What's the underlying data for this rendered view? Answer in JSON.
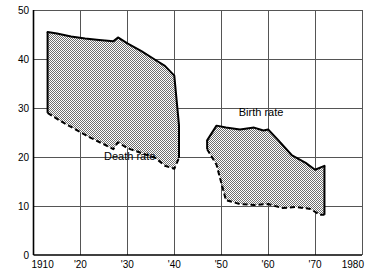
{
  "chart_data": {
    "type": "area",
    "title": "",
    "subtitle": "",
    "xlabel": "",
    "ylabel": "",
    "xlim": [
      1910,
      1980
    ],
    "ylim": [
      0,
      50
    ],
    "grid": true,
    "legend_position": "inline-annotation",
    "x_ticks": [
      {
        "value": 1910,
        "label": "1910"
      },
      {
        "value": 1920,
        "label": "'20"
      },
      {
        "value": 1930,
        "label": "'30"
      },
      {
        "value": 1940,
        "label": "'40"
      },
      {
        "value": 1950,
        "label": "'50"
      },
      {
        "value": 1960,
        "label": "'60"
      },
      {
        "value": 1970,
        "label": "'70"
      },
      {
        "value": 1980,
        "label": "1980"
      }
    ],
    "y_ticks": [
      {
        "value": 0,
        "label": "0"
      },
      {
        "value": 10,
        "label": "10"
      },
      {
        "value": 20,
        "label": "20"
      },
      {
        "value": 30,
        "label": "30"
      },
      {
        "value": 40,
        "label": "40"
      },
      {
        "value": 50,
        "label": "50"
      }
    ],
    "annotations": [
      {
        "id": "death-rate-label",
        "text": "Death rate",
        "x": 1930.5,
        "y": 19.4
      },
      {
        "id": "birth-rate-label",
        "text": "Birth rate",
        "x": 1958.5,
        "y": 28.3
      }
    ],
    "fill_color": "#8c8c8c",
    "line_color": "#000000",
    "grid_color": "#555555",
    "axis_color": "#000000",
    "background_color": "#ffffff",
    "series": [
      {
        "name": "Birth rate",
        "style": "solid-upper-boundary",
        "segments": [
          {
            "id": "early-period",
            "x": [
              1913,
              1915,
              1918,
              1921,
              1924,
              1927,
              1928,
              1930,
              1933,
              1936,
              1938,
              1940,
              1941
            ],
            "values": [
              45.5,
              45.2,
              44.6,
              44.2,
              43.9,
              43.6,
              44.4,
              43.2,
              41.6,
              39.8,
              38.6,
              36.6,
              26.5
            ]
          },
          {
            "id": "postwar-period",
            "x": [
              1947,
              1949,
              1951,
              1954,
              1957,
              1959,
              1960,
              1962,
              1965,
              1968,
              1970,
              1972
            ],
            "values": [
              23.4,
              26.4,
              26.0,
              25.6,
              26.0,
              25.4,
              25.6,
              23.6,
              20.4,
              18.8,
              17.4,
              18.2
            ]
          }
        ]
      },
      {
        "name": "Death rate",
        "style": "dashed-lower-boundary",
        "segments": [
          {
            "id": "early-period",
            "x": [
              1913,
              1916,
              1919,
              1922,
              1925,
              1927,
              1928,
              1930,
              1933,
              1936,
              1938,
              1940,
              1941
            ],
            "values": [
              29.0,
              27.2,
              25.6,
              24.0,
              22.6,
              21.6,
              23.0,
              21.8,
              20.8,
              19.8,
              18.2,
              17.6,
              19.8
            ]
          },
          {
            "id": "postwar-period",
            "x": [
              1947,
              1949,
              1951,
              1954,
              1957,
              1960,
              1963,
              1966,
              1969,
              1971,
              1972
            ],
            "values": [
              21.6,
              18.4,
              11.2,
              10.4,
              10.2,
              10.4,
              9.6,
              9.8,
              9.4,
              8.2,
              8.2
            ]
          }
        ]
      }
    ]
  }
}
